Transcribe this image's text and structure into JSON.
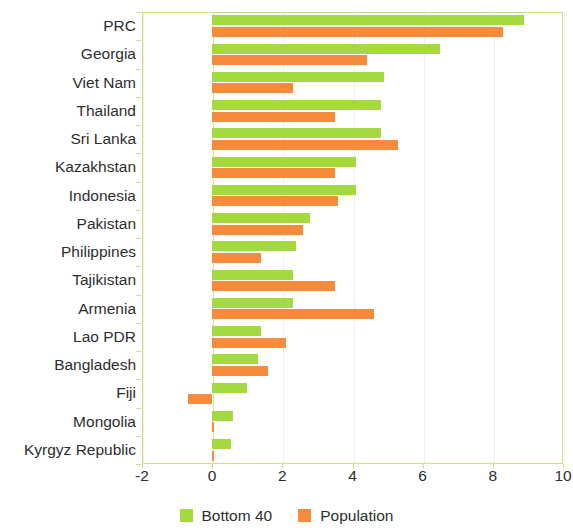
{
  "chart_data": {
    "type": "bar",
    "orientation": "horizontal",
    "title": "",
    "subtitle": "",
    "xlabel": "",
    "ylabel": "",
    "xlim": [
      -2,
      10
    ],
    "xticks": [
      -2,
      0,
      2,
      4,
      6,
      8,
      10
    ],
    "xtick_labels": [
      "-2",
      "0",
      "2",
      "4",
      "6",
      "8",
      "10"
    ],
    "grid": true,
    "grid_axis": "x",
    "legend_position": "bottom-center",
    "categories": [
      "PRC",
      "Georgia",
      "Viet Nam",
      "Thailand",
      "Sri Lanka",
      "Kazakhstan",
      "Indonesia",
      "Pakistan",
      "Philippines",
      "Tajikistan",
      "Armenia",
      "Lao PDR",
      "Bangladesh",
      "Fiji",
      "Mongolia",
      "Kyrgyz Republic"
    ],
    "series": [
      {
        "name": "Bottom 40",
        "color": "#a4d93f",
        "values": [
          8.9,
          6.5,
          4.9,
          4.8,
          4.8,
          4.1,
          4.1,
          2.8,
          2.4,
          2.3,
          2.3,
          1.4,
          1.3,
          1.0,
          0.6,
          0.55
        ]
      },
      {
        "name": "Population",
        "color": "#f68b3c",
        "values": [
          8.3,
          4.4,
          2.3,
          3.5,
          5.3,
          3.5,
          3.6,
          2.6,
          1.4,
          3.5,
          4.6,
          2.1,
          1.6,
          -0.7,
          0.05,
          0.04
        ]
      }
    ]
  },
  "legend": {
    "items": [
      {
        "label": "Bottom 40",
        "color": "#a4d93f"
      },
      {
        "label": "Population",
        "color": "#f68b3c"
      }
    ]
  },
  "colors": {
    "series_bottom40": "#a4d93f",
    "series_population": "#f68b3c",
    "axis": "#cfe08a",
    "grid": "#eef3dd",
    "text": "#2e2e2e",
    "background": "#ffffff"
  }
}
